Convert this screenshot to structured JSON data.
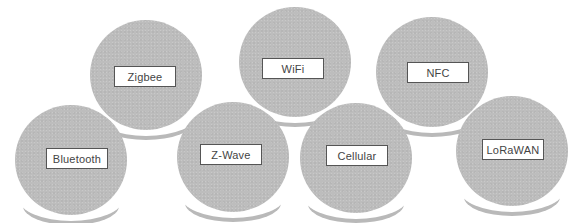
{
  "diagram": {
    "type": "protocol-bubbles",
    "colors": {
      "bubble_fill": "#bdbdbd",
      "bubble_shadow": "#b9b9b9",
      "label_background": "#ffffff",
      "label_border": "#555555",
      "label_text": "#444444",
      "background": "#ffffff"
    },
    "nodes": [
      {
        "id": "zigbee",
        "label": "Zigbee"
      },
      {
        "id": "wifi",
        "label": "WiFi"
      },
      {
        "id": "nfc",
        "label": "NFC"
      },
      {
        "id": "bluetooth",
        "label": "Bluetooth"
      },
      {
        "id": "z-wave",
        "label": "Z-Wave"
      },
      {
        "id": "cellular",
        "label": "Cellular"
      },
      {
        "id": "lorawan",
        "label": "LoRaWAN"
      }
    ]
  }
}
